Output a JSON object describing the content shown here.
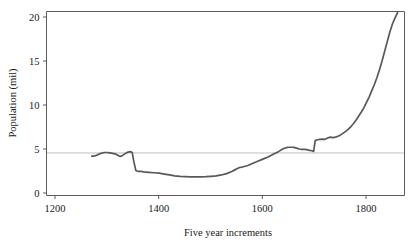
{
  "chart_data": {
    "type": "line",
    "title": "",
    "subtitle": "",
    "xlabel": "Five year increments",
    "ylabel": "Population (mil)",
    "xlim": [
      1200,
      1862
    ],
    "ylim": [
      0,
      21.2
    ],
    "xticks": [
      1200,
      1400,
      1600,
      1800
    ],
    "xtick_labels": [
      "1200",
      "1400",
      "1600",
      "1800"
    ],
    "yticks": [
      0,
      5,
      10,
      15,
      20
    ],
    "ytick_labels": [
      "0",
      "5",
      "10",
      "15",
      "20"
    ],
    "grid": false,
    "legend": null,
    "legend_position": "none",
    "line_color": "#585858",
    "reference_line": {
      "orientation": "horizontal",
      "value": 4.55,
      "color": "#b8b8b8"
    },
    "series": [
      {
        "name": "Population",
        "x": [
          1271,
          1276,
          1281,
          1286,
          1291,
          1296,
          1301,
          1306,
          1311,
          1316,
          1321,
          1326,
          1331,
          1336,
          1341,
          1346,
          1349,
          1352,
          1356,
          1361,
          1366,
          1371,
          1381,
          1391,
          1401,
          1411,
          1421,
          1431,
          1441,
          1451,
          1461,
          1471,
          1481,
          1491,
          1501,
          1511,
          1521,
          1531,
          1541,
          1546,
          1551,
          1556,
          1561,
          1571,
          1581,
          1591,
          1601,
          1611,
          1621,
          1631,
          1641,
          1646,
          1651,
          1656,
          1661,
          1666,
          1671,
          1676,
          1681,
          1686,
          1691,
          1696,
          1699,
          1702,
          1706,
          1711,
          1716,
          1721,
          1726,
          1731,
          1736,
          1741,
          1746,
          1751,
          1756,
          1761,
          1766,
          1771,
          1776,
          1781,
          1786,
          1791,
          1796,
          1801,
          1806,
          1811,
          1816,
          1821,
          1826,
          1831,
          1836,
          1841,
          1846,
          1851,
          1856,
          1861
        ],
        "y": [
          4.2,
          4.2,
          4.3,
          4.45,
          4.55,
          4.6,
          4.6,
          4.55,
          4.5,
          4.45,
          4.3,
          4.15,
          4.3,
          4.5,
          4.65,
          4.7,
          4.6,
          3.6,
          2.55,
          2.45,
          2.45,
          2.4,
          2.35,
          2.3,
          2.25,
          2.15,
          2.05,
          1.95,
          1.88,
          1.85,
          1.83,
          1.83,
          1.84,
          1.86,
          1.9,
          1.95,
          2.05,
          2.2,
          2.45,
          2.6,
          2.75,
          2.9,
          2.95,
          3.1,
          3.35,
          3.6,
          3.85,
          4.1,
          4.4,
          4.7,
          5.05,
          5.15,
          5.2,
          5.2,
          5.18,
          5.1,
          5.0,
          4.95,
          4.95,
          4.92,
          4.85,
          4.8,
          4.72,
          5.95,
          6.05,
          6.1,
          6.12,
          6.1,
          6.25,
          6.35,
          6.3,
          6.35,
          6.45,
          6.6,
          6.8,
          7.0,
          7.25,
          7.55,
          7.9,
          8.3,
          8.75,
          9.2,
          9.7,
          10.3,
          10.9,
          11.6,
          12.3,
          13.1,
          14.0,
          15.0,
          16.1,
          17.2,
          18.3,
          19.2,
          19.9,
          20.5
        ]
      }
    ]
  }
}
